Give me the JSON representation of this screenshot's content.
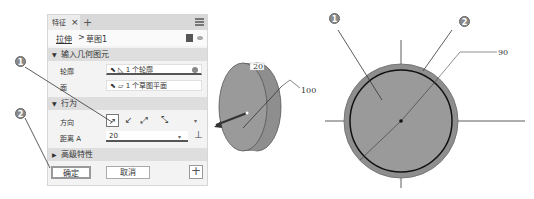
{
  "panel": {
    "tab_label": "特征",
    "tab_close": "×",
    "tab_add": "+",
    "breadcrumb": {
      "feature": "拉伸",
      "separator": ">",
      "sketch": "草图1"
    },
    "sections": {
      "input_geometry": {
        "title": "输入几何图元",
        "rows": [
          {
            "label": "轮廓",
            "value": "1 个轮廓"
          },
          {
            "label": "面",
            "value": "1 个草图平面"
          }
        ]
      },
      "behavior": {
        "title": "行为",
        "direction_label": "方向",
        "distance_label": "距离 A",
        "distance_value": "20"
      },
      "advanced": {
        "title": "高级特性"
      }
    },
    "buttons": {
      "ok": "确定",
      "cancel": "取消",
      "add": "+"
    }
  },
  "callouts": {
    "one": "1",
    "two": "2"
  },
  "model_3d": {
    "depth_dim": "20",
    "diameter_dim": "100"
  },
  "sketch_2d": {
    "diameter_dim": "90"
  }
}
